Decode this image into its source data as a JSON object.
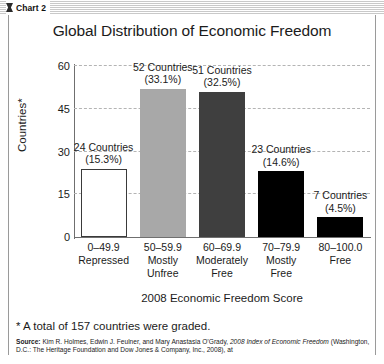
{
  "window": {
    "titlebar_label": "Chart 2",
    "titlebar_icon": "chart-bar-icon"
  },
  "chart_data": {
    "type": "bar",
    "title": "Global Distribution of Economic Freedom",
    "xlabel": "2008 Economic Freedom Score",
    "ylabel": "Countries*",
    "ylim": [
      0,
      60
    ],
    "yticks": [
      "0",
      "15",
      "30",
      "45",
      "60"
    ],
    "grid": "horizontal-dashed",
    "legend": "none",
    "categories": [
      "0–49.9\nRepressed",
      "50–59.9\nMostly Unfree",
      "60–69.9\nModerately Free",
      "70–79.9\nMostly Free",
      "80–100.0\nFree"
    ],
    "values": [
      24,
      52,
      51,
      23,
      7
    ],
    "percents": [
      15.3,
      33.1,
      32.5,
      14.6,
      4.5
    ],
    "bars": [
      {
        "range": "0–49.9",
        "name": "Repressed",
        "value": 24,
        "percent": 15.3,
        "count_label": "24 Countries",
        "percent_label": "(15.3%)",
        "fill": "#ffffff",
        "stroke": "#3a3a3a"
      },
      {
        "range": "50–59.9",
        "name": "Mostly\nUnfree",
        "value": 52,
        "percent": 33.1,
        "count_label": "52 Countries",
        "percent_label": "(33.1%)",
        "fill": "#a8a8a8",
        "stroke": "#a8a8a8"
      },
      {
        "range": "60–69.9",
        "name": "Moderately\nFree",
        "value": 51,
        "percent": 32.5,
        "count_label": "51 Countries",
        "percent_label": "(32.5%)",
        "fill": "#3f3f3f",
        "stroke": "#3f3f3f"
      },
      {
        "range": "70–79.9",
        "name": "Mostly\nFree",
        "value": 23,
        "percent": 14.6,
        "count_label": "23 Countries",
        "percent_label": "(14.6%)",
        "fill": "#000000",
        "stroke": "#000000"
      },
      {
        "range": "80–100.0",
        "name": "Free",
        "value": 7,
        "percent": 4.5,
        "count_label": "7 Countries",
        "percent_label": "(4.5%)",
        "fill": "#000000",
        "stroke": "#000000"
      }
    ]
  },
  "xcats": [
    {
      "range": "0–49.9",
      "line1": "Repressed",
      "line2": ""
    },
    {
      "range": "50–59.9",
      "line1": "Mostly",
      "line2": "Unfree"
    },
    {
      "range": "60–69.9",
      "line1": "Moderately",
      "line2": "Free"
    },
    {
      "range": "70–79.9",
      "line1": "Mostly",
      "line2": "Free"
    },
    {
      "range": "80–100.0",
      "line1": "Free",
      "line2": ""
    }
  ],
  "footnote": "* A total of 157 countries were graded.",
  "source": {
    "label": "Source:",
    "text_before": " Kim R. Holmes, Edwin J. Feulner, and Mary Anastasia O’Grady, ",
    "title_italic": "2008 Index of Economic Freedom",
    "text_after": " (Washington, D.C.: The Heritage Foundation and Dow Jones & Company, Inc., 2008), at"
  }
}
